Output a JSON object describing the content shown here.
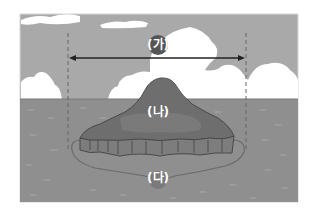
{
  "diagram": {
    "title": "",
    "labels": {
      "ga": "(가)",
      "na": "(나)",
      "da": "(다)"
    },
    "elements": {
      "ga": "width of island marked by double arrow between dashed lines",
      "na": "island above sea level",
      "da": "area surrounding island outline in the sea"
    },
    "colors": {
      "sky": "#a9a9a9",
      "cloud": "#ffffff",
      "sea": "#8f8f8f",
      "island_top": "#6e6e6e",
      "island_cliff": "#7d7d7d",
      "label_circle": "#555555",
      "arrow": "#222222",
      "dashed_line": "#666666",
      "outline": "#6a6a6a"
    }
  }
}
